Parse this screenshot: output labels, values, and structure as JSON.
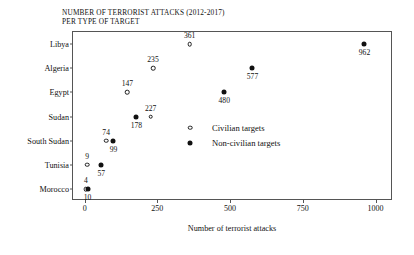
{
  "chart_data": {
    "type": "scatter",
    "title": "NUMBER OF TERRORIST ATTACKS (2012-2017)",
    "subtitle": "PER TYPE OF TARGET",
    "xlabel": "Number of terrorist attacks",
    "ylabel": "",
    "xlim": [
      -40,
      1060
    ],
    "xticks": [
      0,
      250,
      500,
      750,
      1000
    ],
    "xticklabels": [
      "0",
      "250",
      "500",
      "750",
      "1000"
    ],
    "categories": [
      "Libya",
      "Algeria",
      "Egypt",
      "Sudan",
      "South Sudan",
      "Tunisia",
      "Morocco"
    ],
    "grid": false,
    "legend_position": "inside-lower-right",
    "series": [
      {
        "name": "Civilian targets",
        "marker": "open-circle",
        "color": "#111111",
        "values": [
          361,
          235,
          147,
          227,
          74,
          9,
          4
        ]
      },
      {
        "name": "Non-civilian targets",
        "marker": "filled-circle",
        "color": "#111111",
        "values": [
          962,
          577,
          480,
          178,
          99,
          57,
          10
        ]
      }
    ],
    "points": [
      {
        "category": "Libya",
        "series": "Civilian targets",
        "value": 361,
        "label": "361",
        "label_pos": "above"
      },
      {
        "category": "Libya",
        "series": "Non-civilian targets",
        "value": 962,
        "label": "962",
        "label_pos": "below"
      },
      {
        "category": "Algeria",
        "series": "Civilian targets",
        "value": 235,
        "label": "235",
        "label_pos": "above"
      },
      {
        "category": "Algeria",
        "series": "Non-civilian targets",
        "value": 577,
        "label": "577",
        "label_pos": "below"
      },
      {
        "category": "Egypt",
        "series": "Civilian targets",
        "value": 147,
        "label": "147",
        "label_pos": "above"
      },
      {
        "category": "Egypt",
        "series": "Non-civilian targets",
        "value": 480,
        "label": "480",
        "label_pos": "below"
      },
      {
        "category": "Sudan",
        "series": "Civilian targets",
        "value": 227,
        "label": "227",
        "label_pos": "above"
      },
      {
        "category": "Sudan",
        "series": "Non-civilian targets",
        "value": 178,
        "label": "178",
        "label_pos": "below"
      },
      {
        "category": "South Sudan",
        "series": "Civilian targets",
        "value": 74,
        "label": "74",
        "label_pos": "above"
      },
      {
        "category": "South Sudan",
        "series": "Non-civilian targets",
        "value": 99,
        "label": "99",
        "label_pos": "below"
      },
      {
        "category": "Tunisia",
        "series": "Civilian targets",
        "value": 9,
        "label": "9",
        "label_pos": "above"
      },
      {
        "category": "Tunisia",
        "series": "Non-civilian targets",
        "value": 57,
        "label": "57",
        "label_pos": "below"
      },
      {
        "category": "Morocco",
        "series": "Civilian targets",
        "value": 4,
        "label": "4",
        "label_pos": "above"
      },
      {
        "category": "Morocco",
        "series": "Non-civilian targets",
        "value": 10,
        "label": "10",
        "label_pos": "below"
      }
    ]
  }
}
